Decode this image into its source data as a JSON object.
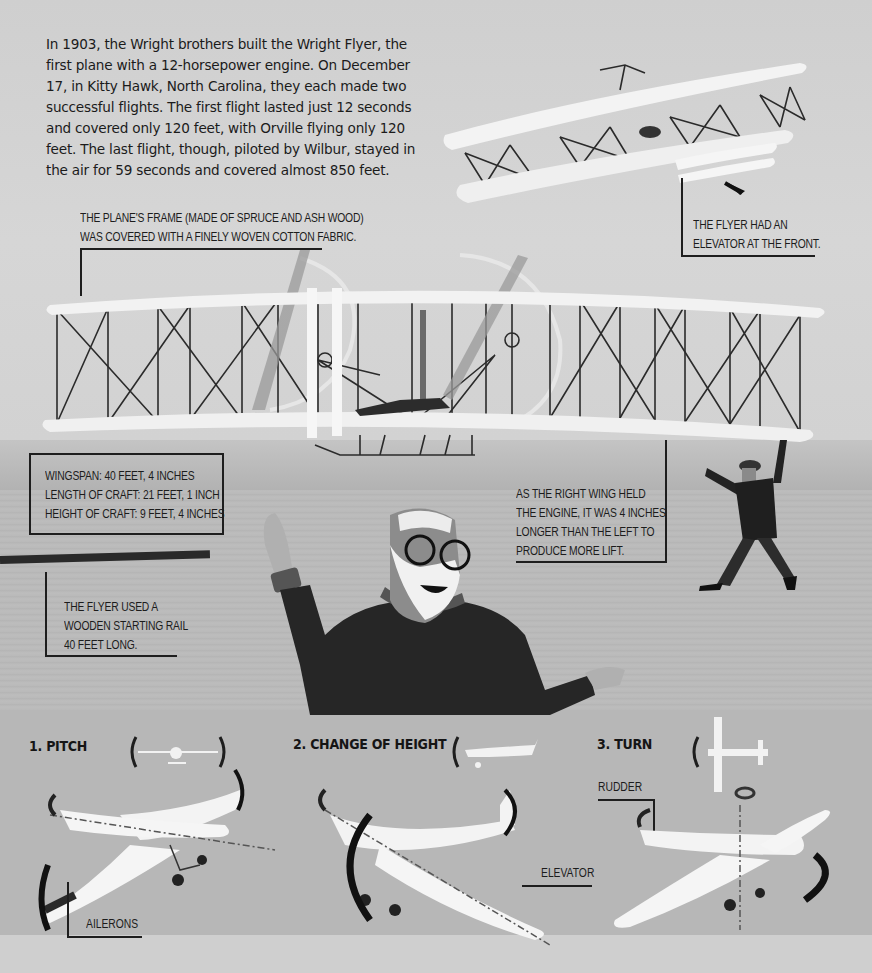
{
  "intro": {
    "text": "In 1903, the Wright brothers built the Wright Flyer, the first plane with a 12-horsepower engine. On December 17, in Kitty Hawk, North Carolina, they each made two successful flights. The first flight lasted just 12 seconds and covered only 120 feet, with Orville flying only 120 feet. The last flight, though, piloted by Wilbur, stayed in the air for 59 seconds and covered almost 850 feet."
  },
  "captions": {
    "elevator": [
      "THE FLYER HAD AN",
      "ELEVATOR AT THE FRONT."
    ],
    "frame": [
      "THE PLANE'S FRAME (MADE OF SPRUCE AND ASH WOOD)",
      "WAS COVERED WITH A FINELY WOVEN COTTON FABRIC."
    ],
    "specs": [
      "WINGSPAN: 40 FEET, 4 INCHES",
      "LENGTH OF CRAFT: 21 FEET, 1 INCH",
      "HEIGHT OF CRAFT: 9 FEET, 4 INCHES"
    ],
    "right_wing": [
      "AS THE RIGHT WING HELD",
      "THE ENGINE, IT WAS 4 INCHES",
      "LONGER THAN THE LEFT TO",
      "PRODUCE MORE LIFT."
    ],
    "rail": [
      "THE FLYER USED A",
      "WOODEN STARTING RAIL",
      "40 FEET LONG."
    ]
  },
  "controls": {
    "sections": [
      {
        "title": "1. PITCH",
        "label": "AILERONS"
      },
      {
        "title": "2. CHANGE OF HEIGHT",
        "label": "ELEVATOR"
      },
      {
        "title": "3. TURN",
        "label": "RUDDER"
      }
    ]
  },
  "colors": {
    "sky": "#d4d4d4",
    "ground": "#b8b8b8",
    "panel": "#b7b7b7",
    "ink": "#1e1e1e",
    "wing": "#f2f2f2"
  }
}
